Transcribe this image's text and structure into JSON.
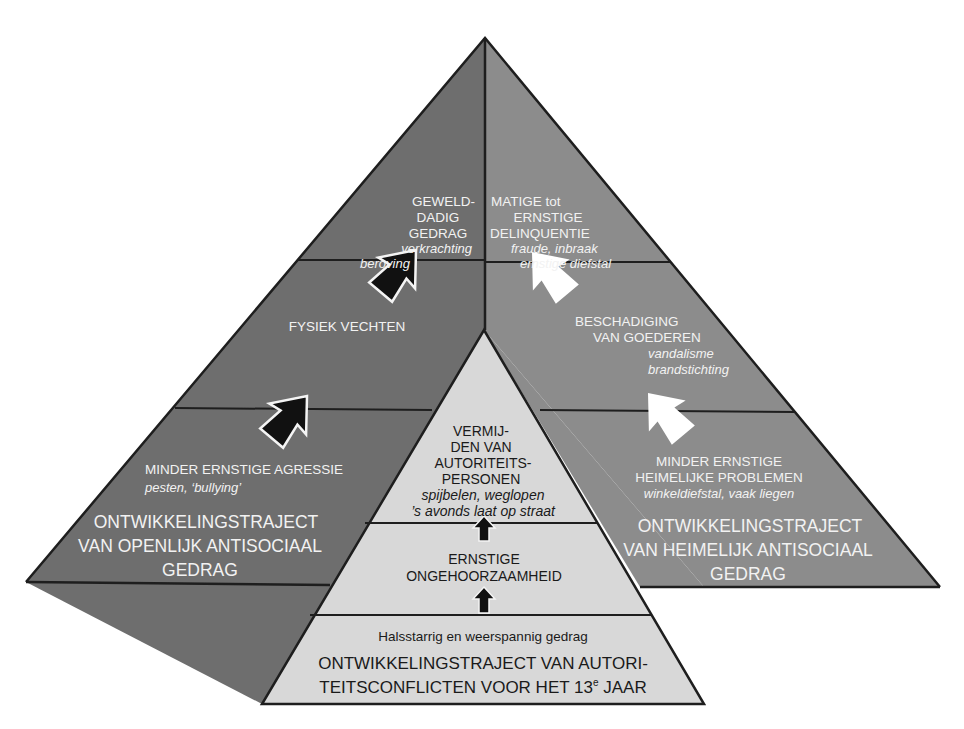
{
  "diagram": {
    "type": "nested-pyramid",
    "colors": {
      "overt_side": "#6e6e6e",
      "covert_side": "#8c8c8c",
      "authority_pyramid": "#d8d8d8",
      "outline": "#1e1e1e",
      "light_text": "#f2f2f2",
      "dark_text": "#1a1a1a"
    },
    "overt_pathway": {
      "levels": [
        {
          "title": [
            "GEWELD-",
            "DADIG",
            "GEDRAG"
          ],
          "examples": [
            "verkrachting",
            "beroving"
          ]
        },
        {
          "title": [
            "FYSIEK VECHTEN"
          ],
          "examples": []
        },
        {
          "title": [
            "MINDER ERNSTIGE AGRESSIE"
          ],
          "examples": [
            "pesten, ‘bullying’"
          ]
        }
      ],
      "label": [
        "ONTWIKKELINGSTRAJECT",
        "VAN OPENLIJK ANTISOCIAAL",
        "GEDRAG"
      ],
      "arrow_style": "black"
    },
    "covert_pathway": {
      "levels": [
        {
          "title": [
            "MATIGE tot",
            "ERNSTIGE",
            "DELINQUENTIE"
          ],
          "examples": [
            "fraude, inbraak",
            "ernstige diefstal"
          ]
        },
        {
          "title": [
            "BESCHADIGING",
            "VAN GOEDEREN"
          ],
          "examples": [
            "vandalisme",
            "brandstichting"
          ]
        },
        {
          "title": [
            "MINDER ERNSTIGE",
            "HEIMELIJKE PROBLEMEN"
          ],
          "examples": [
            "winkeldiefstal, vaak liegen"
          ]
        }
      ],
      "label": [
        "ONTWIKKELINGSTRAJECT",
        "VAN HEIMELIJK ANTISOCIAAL",
        "GEDRAG"
      ],
      "arrow_style": "white"
    },
    "authority_pathway": {
      "levels": [
        {
          "title": [
            "VERMIJ-",
            "DEN VAN",
            "AUTORITEITS-",
            "PERSONEN"
          ],
          "examples": [
            "spijbelen, weglopen",
            "’s avonds laat op straat"
          ]
        },
        {
          "title": [
            "ERNSTIGE",
            "ONGEHOORZAAMHEID"
          ],
          "examples": []
        },
        {
          "title": [],
          "examples": [
            "Halsstarrig en weerspannig gedrag"
          ]
        }
      ],
      "label": [
        "ONTWIKKELINGSTRAJECT VAN AUTORI-",
        "TEITSCONFLICTEN VOOR HET 13"
      ],
      "label_superscript": "e",
      "label_suffix": " JAAR",
      "arrow_style": "black-vertical"
    }
  }
}
